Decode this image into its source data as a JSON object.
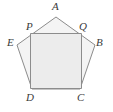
{
  "figure": {
    "background_color": "#ffffff",
    "stroke_color": "#8c8c8c",
    "stroke_width": 1,
    "pentagon_fill": "#f4f4f4",
    "square_fill": "#ececec",
    "label_color": "#3a3a3a",
    "pentagon": {
      "name": "pentagon-abcde",
      "points": "56,17 95,45 80,89 32,89 17,45"
    },
    "square": {
      "name": "square-pqcd",
      "points": "30.5,33.5 81.5,33.5 81.5,88.5 30.5,88.5"
    },
    "labels": [
      {
        "id": "A",
        "text": "A",
        "x": 52,
        "y": 1
      },
      {
        "id": "P",
        "text": "P",
        "x": 26,
        "y": 21
      },
      {
        "id": "Q",
        "text": "Q",
        "x": 79,
        "y": 21
      },
      {
        "id": "E",
        "text": "E",
        "x": 7,
        "y": 37
      },
      {
        "id": "B",
        "text": "B",
        "x": 96,
        "y": 37
      },
      {
        "id": "D",
        "text": "D",
        "x": 26,
        "y": 92
      },
      {
        "id": "C",
        "text": "C",
        "x": 77,
        "y": 92
      }
    ]
  }
}
